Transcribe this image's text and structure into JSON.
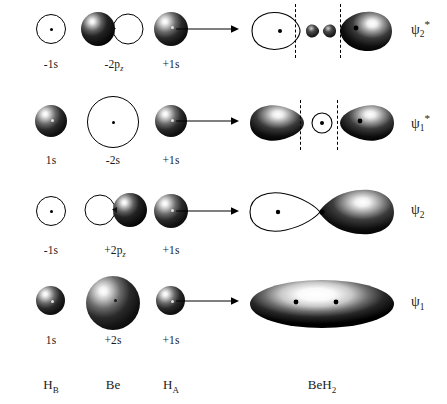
{
  "figure": {
    "type": "molecular-orbital-diagram",
    "molecule": "BeH2",
    "left_group_heading": "atomic orbitals",
    "right_group_heading": "molecular orbitals"
  },
  "axis_labels": {
    "h_b": "H",
    "h_b_sub": "B",
    "be": "Be",
    "h_a": "H",
    "h_a_sub": "A",
    "product": "BeH",
    "product_sub": "2"
  },
  "rows": [
    {
      "id": "psi2-star",
      "mo_label": "ψ",
      "mo_sub": "2",
      "mo_sup": "*",
      "ao": [
        {
          "sign": "-",
          "orbital": "1",
          "type": "s",
          "sub": ""
        },
        {
          "sign": "-",
          "orbital": "2",
          "type": "p",
          "sub": "z"
        },
        {
          "sign": "+",
          "orbital": "1",
          "type": "s",
          "sub": ""
        }
      ],
      "nodal_planes": 2
    },
    {
      "id": "psi1-star",
      "mo_label": "ψ",
      "mo_sub": "1",
      "mo_sup": "*",
      "ao": [
        {
          "sign": "",
          "orbital": "1",
          "type": "s",
          "sub": ""
        },
        {
          "sign": "-",
          "orbital": "2",
          "type": "s",
          "sub": ""
        },
        {
          "sign": "+",
          "orbital": "1",
          "type": "s",
          "sub": ""
        }
      ],
      "nodal_planes": 2
    },
    {
      "id": "psi2",
      "mo_label": "ψ",
      "mo_sub": "2",
      "mo_sup": "",
      "ao": [
        {
          "sign": "-",
          "orbital": "1",
          "type": "s",
          "sub": ""
        },
        {
          "sign": "+",
          "orbital": "2",
          "type": "p",
          "sub": "z"
        },
        {
          "sign": "+",
          "orbital": "1",
          "type": "s",
          "sub": ""
        }
      ],
      "nodal_planes": 0
    },
    {
      "id": "psi1",
      "mo_label": "ψ",
      "mo_sub": "1",
      "mo_sup": "",
      "ao": [
        {
          "sign": "",
          "orbital": "1",
          "type": "s",
          "sub": ""
        },
        {
          "sign": "+",
          "orbital": "2",
          "type": "s",
          "sub": ""
        },
        {
          "sign": "+",
          "orbital": "1",
          "type": "s",
          "sub": ""
        }
      ],
      "nodal_planes": 0
    }
  ],
  "ao_label_text": {
    "r1c1": "-1s",
    "r1c2": "-2p",
    "r1c2sub": "z",
    "r1c3": "+1s",
    "r2c1": "1s",
    "r2c2": "-2s",
    "r2c3": "+1s",
    "r3c1": "-1s",
    "r3c2": "+2p",
    "r3c2sub": "z",
    "r3c3": "+1s",
    "r4c1": "1s",
    "r4c2": "+2s",
    "r4c3": "+1s"
  },
  "mo_labels": {
    "row1": "ψ",
    "row1sub": "2",
    "row1sup": "*",
    "row2": "ψ",
    "row2sub": "1",
    "row2sup": "*",
    "row3": "ψ",
    "row3sub": "2",
    "row3sup": "",
    "row4": "ψ",
    "row4sub": "1",
    "row4sup": ""
  },
  "colors": {
    "ink": "#000000",
    "background": "#ffffff",
    "lobe_fill_dark": "#111111",
    "lobe_fill_light": "#ffffff"
  },
  "arrow": {
    "name": "combination-arrow",
    "count": 4,
    "direction": "right"
  }
}
